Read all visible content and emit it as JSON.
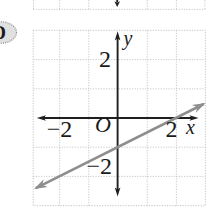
{
  "colors": {
    "ink": "#1a1a1a",
    "axis": "#1f1f1f",
    "grid": "#c3c3c3",
    "line": "#8e8e8e",
    "ovalFill": "#e0e0e0",
    "ovalStroke": "#8a8a8a"
  },
  "answer_choice": {
    "label": "D"
  },
  "graph": {
    "x_axis_label": "x",
    "y_axis_label": "y",
    "origin_label": "O",
    "x_tick_left": "−2",
    "x_tick_right": "2",
    "y_tick_top": "2",
    "y_tick_bottom": "−2"
  },
  "chart_data": {
    "type": "line",
    "title": "",
    "xlabel": "x",
    "ylabel": "y",
    "xlim": [
      -3,
      3
    ],
    "ylim": [
      -3,
      3
    ],
    "grid": true,
    "x_tick_labels": [
      "−2",
      "2"
    ],
    "y_tick_labels": [
      "2",
      "−2"
    ],
    "origin_label": "O",
    "series": [
      {
        "name": "graphed-line",
        "slope": 0.5,
        "y_intercept": -1,
        "x_intercept": 2,
        "endpoints": [
          [
            -2.8,
            -2.4
          ],
          [
            2.95,
            0.48
          ]
        ]
      }
    ]
  }
}
